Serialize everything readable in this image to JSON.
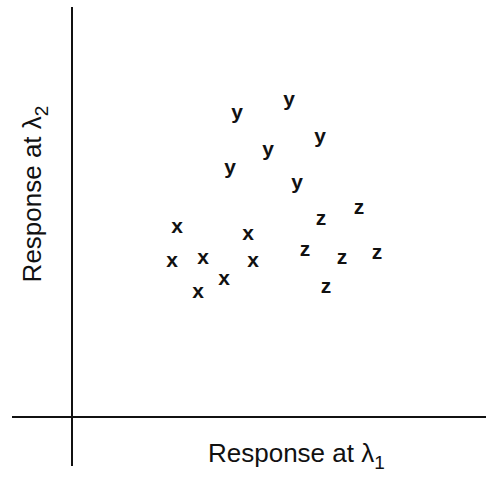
{
  "chart_data": {
    "type": "scatter",
    "title": "",
    "xlabel": "Response at λ1",
    "ylabel": "Response at λ2",
    "xlabel_main": "Response at λ",
    "xlabel_sub": "1",
    "ylabel_main": "Response at λ",
    "ylabel_sub": "2",
    "grid": false,
    "legend": "none (class letters used as markers)",
    "xlim": [
      0,
      100
    ],
    "ylim": [
      0,
      100
    ],
    "series": [
      {
        "name": "x",
        "marker": "x",
        "points": [
          {
            "x": 25.3,
            "y": 46.6,
            "px": 177,
            "py": 227
          },
          {
            "x": 40.3,
            "y": 44.8,
            "px": 248,
            "py": 234
          },
          {
            "x": 24.3,
            "y": 38.1,
            "px": 172,
            "py": 261
          },
          {
            "x": 30.8,
            "y": 38.8,
            "px": 203,
            "py": 258
          },
          {
            "x": 41.4,
            "y": 38.1,
            "px": 253,
            "py": 261
          },
          {
            "x": 35.2,
            "y": 33.7,
            "px": 224,
            "py": 279
          },
          {
            "x": 29.7,
            "y": 30.5,
            "px": 198,
            "py": 292
          }
        ]
      },
      {
        "name": "y",
        "marker": "y",
        "points": [
          {
            "x": 34.2,
            "y": 74.5,
            "px": 237,
            "py": 113
          },
          {
            "x": 45.2,
            "y": 77.7,
            "px": 289,
            "py": 100
          },
          {
            "x": 51.7,
            "y": 68.7,
            "px": 320,
            "py": 137
          },
          {
            "x": 40.7,
            "y": 65.5,
            "px": 268,
            "py": 150
          },
          {
            "x": 32.7,
            "y": 61.1,
            "px": 230,
            "py": 168
          },
          {
            "x": 47.9,
            "y": 57.4,
            "px": 297,
            "py": 183
          }
        ]
      },
      {
        "name": "z",
        "marker": "z",
        "points": [
          {
            "x": 60.6,
            "y": 51.5,
            "px": 359,
            "py": 208
          },
          {
            "x": 52.5,
            "y": 48.8,
            "px": 321,
            "py": 219
          },
          {
            "x": 49.2,
            "y": 41.2,
            "px": 305,
            "py": 250
          },
          {
            "x": 57.0,
            "y": 39.2,
            "px": 342,
            "py": 258
          },
          {
            "x": 64.4,
            "y": 40.4,
            "px": 377,
            "py": 253
          },
          {
            "x": 53.6,
            "y": 32.2,
            "px": 326,
            "py": 287
          }
        ]
      }
    ],
    "axes": {
      "origin_px": [
        72,
        417
      ],
      "x_axis_px": {
        "from": 12,
        "to": 486,
        "y": 417
      },
      "y_axis_px": {
        "x": 72,
        "from": 7,
        "to": 466
      },
      "ticks": "none"
    }
  }
}
